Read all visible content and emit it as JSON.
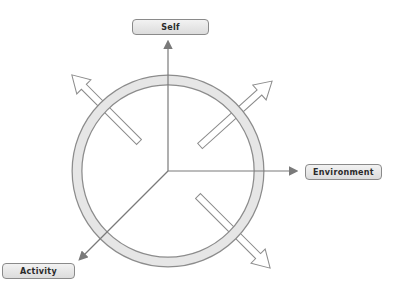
{
  "diagram": {
    "labels": {
      "self": "Self",
      "environment": "Environment",
      "activity": "Activity"
    },
    "colors": {
      "ring_fill": "#e6e6e6",
      "stroke": "#8c8c8c",
      "arrow_fill": "#ffffff",
      "line": "#7a7a7a",
      "label_bg": "#e4e4e4"
    },
    "center": [
      168,
      171
    ],
    "ring": {
      "outer_radius": 96,
      "thickness": 10
    },
    "axes": [
      {
        "name": "self",
        "direction": "up"
      },
      {
        "name": "environment",
        "direction": "right"
      },
      {
        "name": "activity",
        "direction": "down-left"
      }
    ],
    "hollow_arrows": [
      {
        "direction": "up-left"
      },
      {
        "direction": "up-right"
      },
      {
        "direction": "down-right"
      }
    ]
  }
}
